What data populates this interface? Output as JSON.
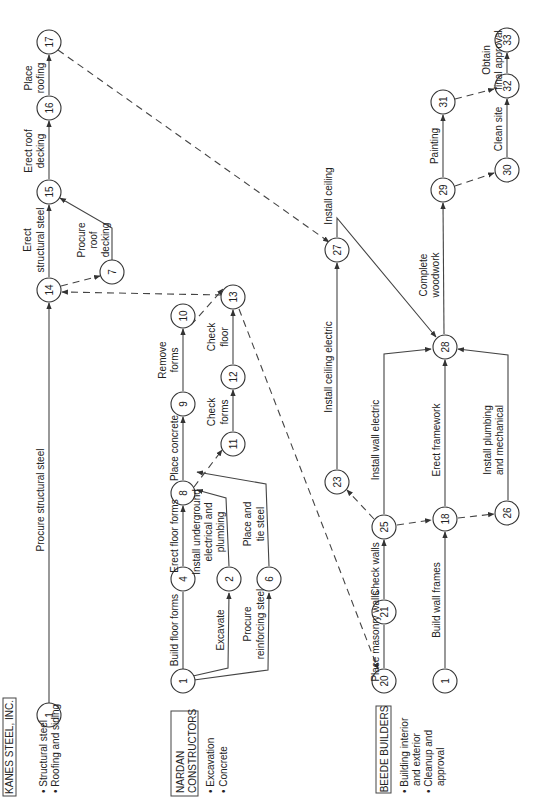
{
  "diagram": {
    "orientation": "rotated 90 degrees counter-clockwise",
    "type": "activity-on-arrow project network",
    "contractors": [
      {
        "name": "KANES STEEL, INC.",
        "scope": [
          "Structural steel",
          "Roofing and siding"
        ]
      },
      {
        "name_lines": [
          "NARDAN",
          "CONSTRUCTORS"
        ],
        "scope": [
          "Excavation",
          "Concrete"
        ]
      },
      {
        "name": "BEEDE BUILDERS",
        "scope_lines": [
          "Building interior",
          "and exterior",
          "Cleanup and",
          "approval"
        ]
      }
    ],
    "nodes": {
      "k1": "1",
      "n14": "14",
      "n15": "15",
      "n16": "16",
      "n17": "17",
      "n7": "7",
      "d1": "1",
      "n4": "4",
      "n2": "2",
      "n6": "6",
      "n8": "8",
      "n9": "9",
      "n10": "10",
      "n11": "11",
      "n12": "12",
      "n13": "13",
      "n20": "20",
      "n21": "21",
      "n25": "25",
      "n23": "23",
      "n27": "27",
      "b1": "1",
      "n18": "18",
      "n26": "26",
      "n28": "28",
      "n29": "29",
      "n30": "30",
      "n31": "31",
      "n32": "32",
      "n33": "33"
    },
    "activities": {
      "procure_structural_steel": "Procure structural steel",
      "erect_structural_steel_1": "Erect",
      "erect_structural_steel_2": "structural steel",
      "procure_roof_decking_1": "Procure",
      "procure_roof_decking_2": "roof",
      "procure_roof_decking_3": "decking",
      "erect_roof_decking_1": "Erect roof",
      "erect_roof_decking_2": "decking",
      "place_roofing_1": "Place",
      "place_roofing_2": "roofing",
      "build_floor_forms": "Build floor forms",
      "excavate": "Excavate",
      "procure_reinforcing_steel_1": "Procure",
      "procure_reinforcing_steel_2": "reinforcing steel",
      "erect_floor_forms": "Erect floor forms",
      "install_underground_1": "Install underground",
      "install_underground_2": "electrical  and",
      "install_underground_3": "plumbing",
      "place_tie_steel_1": "Place and",
      "place_tie_steel_2": "tie steel",
      "place_concrete": "Place concrete",
      "check_forms_1": "Check",
      "check_forms_2": "forms",
      "remove_forms_1": "Remove",
      "remove_forms_2": "forms",
      "check_floor_1": "Check",
      "check_floor_2": "floor",
      "place_masonry_walls": "Place masonry walls",
      "check_walls": "Check walls",
      "install_wall_electric": "Install wall electric",
      "install_ceiling_electric": "Install ceiling electric",
      "install_ceiling": "Install ceiling",
      "build_wall_frames": "Build wall frames",
      "erect_framework": "Erect framework",
      "install_plumbing_1": "Install plumbing",
      "install_plumbing_2": "and mechanical",
      "complete_woodwork_1": "Complete",
      "complete_woodwork_2": "woodwork",
      "painting": "Painting",
      "clean_site": "Clean site",
      "obtain_approval_1": "Obtain",
      "obtain_approval_2": "final approval"
    },
    "edges": [
      {
        "from": "1 (Kanes)",
        "to": "14",
        "label": "Procure structural steel",
        "style": "solid"
      },
      {
        "from": "14",
        "to": "15",
        "label": "Erect structural steel",
        "style": "solid"
      },
      {
        "from": "14",
        "to": "7",
        "label": "",
        "style": "dashed"
      },
      {
        "from": "7",
        "to": "15",
        "label": "Procure roof decking",
        "style": "solid"
      },
      {
        "from": "15",
        "to": "16",
        "label": "Erect roof decking",
        "style": "solid"
      },
      {
        "from": "16",
        "to": "17",
        "label": "Place roofing",
        "style": "solid"
      },
      {
        "from": "17",
        "to": "27",
        "label": "",
        "style": "dashed"
      },
      {
        "from": "1 (Nardan)",
        "to": "4",
        "label": "Build floor forms",
        "style": "solid"
      },
      {
        "from": "1 (Nardan)",
        "to": "2",
        "label": "Excavate",
        "style": "solid"
      },
      {
        "from": "1 (Nardan)",
        "to": "6",
        "label": "Procure reinforcing steel",
        "style": "solid"
      },
      {
        "from": "4",
        "to": "8",
        "label": "Erect floor forms",
        "style": "solid"
      },
      {
        "from": "2",
        "to": "8",
        "label": "Install underground electrical and plumbing",
        "style": "solid"
      },
      {
        "from": "6",
        "to": "8",
        "label": "Place and tie steel",
        "style": "solid"
      },
      {
        "from": "8",
        "to": "9",
        "label": "Place concrete",
        "style": "solid"
      },
      {
        "from": "8",
        "to": "11",
        "label": "",
        "style": "dashed"
      },
      {
        "from": "11",
        "to": "12",
        "label": "Check forms",
        "style": "solid"
      },
      {
        "from": "12",
        "to": "13",
        "label": "Check floor",
        "style": "solid"
      },
      {
        "from": "9",
        "to": "10",
        "label": "Remove forms",
        "style": "solid"
      },
      {
        "from": "10",
        "to": "13",
        "label": "",
        "style": "dashed"
      },
      {
        "from": "13",
        "to": "14",
        "label": "",
        "style": "dashed"
      },
      {
        "from": "13",
        "to": "20",
        "label": "",
        "style": "dashed"
      },
      {
        "from": "20",
        "to": "21",
        "label": "Place masonry walls",
        "style": "solid"
      },
      {
        "from": "21",
        "to": "25",
        "label": "Check walls",
        "style": "solid"
      },
      {
        "from": "25",
        "to": "23",
        "label": "",
        "style": "dashed"
      },
      {
        "from": "25",
        "to": "18",
        "label": "",
        "style": "dashed"
      },
      {
        "from": "25",
        "to": "28",
        "label": "Install wall electric",
        "style": "solid"
      },
      {
        "from": "23",
        "to": "27",
        "label": "Install ceiling electric",
        "style": "solid"
      },
      {
        "from": "27",
        "to": "28",
        "label": "Install ceiling",
        "style": "solid"
      },
      {
        "from": "1 (Beede)",
        "to": "18",
        "label": "Build wall frames",
        "style": "solid"
      },
      {
        "from": "18",
        "to": "28",
        "label": "Erect framework",
        "style": "solid"
      },
      {
        "from": "18",
        "to": "26",
        "label": "",
        "style": "dashed"
      },
      {
        "from": "26",
        "to": "28",
        "label": "Install plumbing and mechanical",
        "style": "solid"
      },
      {
        "from": "28",
        "to": "29",
        "label": "Complete woodwork",
        "style": "solid"
      },
      {
        "from": "29",
        "to": "31",
        "label": "Painting",
        "style": "solid"
      },
      {
        "from": "29",
        "to": "30",
        "label": "",
        "style": "dashed"
      },
      {
        "from": "30",
        "to": "32",
        "label": "Clean site",
        "style": "solid"
      },
      {
        "from": "31",
        "to": "32",
        "label": "",
        "style": "dashed"
      },
      {
        "from": "32",
        "to": "33",
        "label": "Obtain final approval",
        "style": "solid"
      }
    ]
  }
}
